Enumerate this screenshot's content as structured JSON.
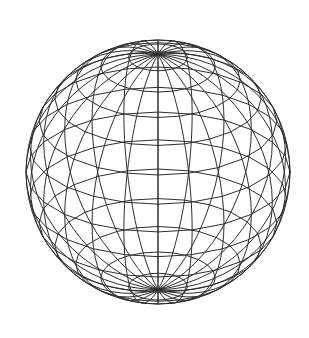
{
  "figure": {
    "name": "wireframe-sphere",
    "background_color": "#ffffff",
    "canvas": {
      "width": 309,
      "height": 338
    }
  },
  "chart_data": {
    "type": "scatter",
    "subtitle": "",
    "xlabel": "",
    "ylabel": "",
    "grid": false,
    "legend": null,
    "annotations": [],
    "geometry": {
      "shape": "sphere",
      "projection": "orthographic",
      "render_style": "wireframe-polyline",
      "hidden_line_removal": false,
      "center_x": 158,
      "center_y": 172,
      "radius": 132,
      "meridian_count": 24,
      "parallel_count": 13,
      "meridian_step_deg": 15,
      "parallel_step_deg": 12.857,
      "camera_elevation_deg": 27,
      "camera_azimuth_deg": 0,
      "north_pole_screen_x": 160,
      "north_pole_screen_y": 54,
      "silhouette_top_y": 40,
      "silhouette_bottom_y": 304,
      "silhouette_left_x": 26,
      "silhouette_right_x": 290
    },
    "style": {
      "stroke_color": "#2e2e2e",
      "stroke_width": 1.0,
      "fill": "none"
    },
    "parallels_latitude_deg": [
      77.1,
      64.3,
      51.4,
      38.6,
      25.7,
      12.9,
      0,
      -12.9,
      -25.7,
      -38.6,
      -51.4,
      -64.3,
      -77.1
    ],
    "meridians_longitude_deg": [
      0,
      15,
      30,
      45,
      60,
      75,
      90,
      105,
      120,
      135,
      150,
      165,
      180,
      195,
      210,
      225,
      240,
      255,
      270,
      285,
      300,
      315,
      330,
      345
    ]
  }
}
